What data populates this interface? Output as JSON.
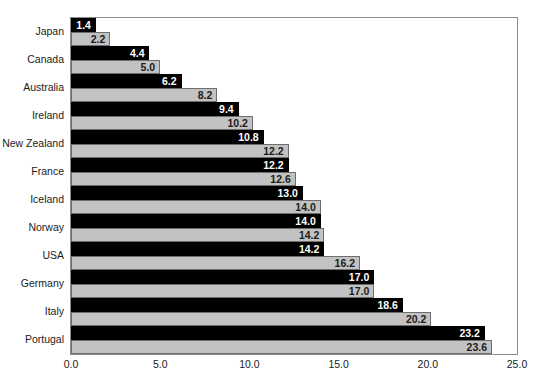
{
  "chart_data": {
    "type": "bar",
    "orientation": "horizontal",
    "title": "",
    "xlabel": "",
    "ylabel": "",
    "xlim": [
      0.0,
      25.0
    ],
    "xticks": [
      "0.0",
      "5.0",
      "10.0",
      "15.0",
      "20.0",
      "25.0"
    ],
    "xtick_values": [
      0.0,
      5.0,
      10.0,
      15.0,
      20.0,
      25.0
    ],
    "grid": false,
    "legend": "none",
    "categories": [
      "Japan",
      "Canada",
      "Australia",
      "Ireland",
      "New Zealand",
      "France",
      "Iceland",
      "Norway",
      "USA",
      "Germany",
      "Italy",
      "Portugal"
    ],
    "series": [
      {
        "name": "series-1",
        "color": "#000000",
        "values": [
          1.4,
          4.4,
          6.2,
          9.4,
          10.8,
          12.2,
          13.0,
          14.0,
          14.2,
          17.0,
          18.6,
          23.2
        ],
        "labels": [
          "1.4",
          "4.4",
          "6.2",
          "9.4",
          "10.8",
          "12.2",
          "13.0",
          "14.0",
          "14.2",
          "17.0",
          "18.6",
          "23.2"
        ]
      },
      {
        "name": "series-2",
        "color": "#c2c2c2",
        "values": [
          2.2,
          5.0,
          8.2,
          10.2,
          12.2,
          12.6,
          14.0,
          14.2,
          16.2,
          17.0,
          20.2,
          23.6
        ],
        "labels": [
          "2.2",
          "5.0",
          "8.2",
          "10.2",
          "12.2",
          "12.6",
          "14.0",
          "14.2",
          "16.2",
          "17.0",
          "20.2",
          "23.6"
        ]
      }
    ]
  }
}
